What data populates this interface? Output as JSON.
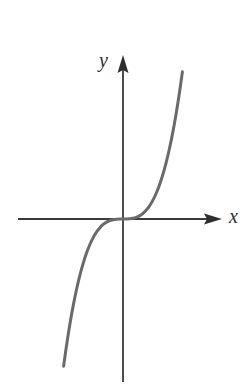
{
  "figure": {
    "background_color": "#ffffff",
    "width": 251,
    "height": 388
  },
  "axes": {
    "x_axis": {
      "label": "x",
      "icon": "arrow-right-icon",
      "color": "#3a3a3a",
      "start_px": [
        18,
        219
      ],
      "end_px": [
        222,
        219
      ],
      "arrow": "right"
    },
    "y_axis": {
      "label": "y",
      "icon": "arrow-up-icon",
      "color": "#3a3a3a",
      "start_px": [
        123,
        382
      ],
      "end_px": [
        123,
        55
      ],
      "arrow": "up"
    },
    "origin_px": [
      123,
      219
    ]
  },
  "curve": {
    "name": "cubic-curve",
    "color": "#6a6a6a",
    "stroke_width": 3,
    "equation": "y = x^3"
  },
  "chart_data": {
    "type": "line",
    "title": "",
    "subtitle": "",
    "xlabel": "x",
    "ylabel": "y",
    "grid": false,
    "legend_position": "none",
    "xlim": [
      -3.0,
      3.0
    ],
    "ylim": [
      -6.5,
      6.5
    ],
    "axis_arrows": {
      "x": "right",
      "y": "up"
    },
    "origin_shown": true,
    "tick_labels": {
      "x": [],
      "y": []
    },
    "annotations": [],
    "series": [
      {
        "name": "y = x^3",
        "equation": "y = x^3",
        "color": "#6a6a6a",
        "x": [
          -1.8,
          -1.7,
          -1.6,
          -1.5,
          -1.4,
          -1.3,
          -1.2,
          -1.1,
          -1.0,
          -0.9,
          -0.8,
          -0.7,
          -0.6,
          -0.5,
          -0.4,
          -0.3,
          -0.2,
          -0.1,
          0.0,
          0.1,
          0.2,
          0.3,
          0.4,
          0.5,
          0.6,
          0.7,
          0.8,
          0.9,
          1.0,
          1.1,
          1.2,
          1.3,
          1.4,
          1.5,
          1.6,
          1.7,
          1.8
        ],
        "y": [
          -5.832,
          -4.913,
          -4.096,
          -3.375,
          -2.744,
          -2.197,
          -1.728,
          -1.331,
          -1.0,
          -0.729,
          -0.512,
          -0.343,
          -0.216,
          -0.125,
          -0.064,
          -0.027,
          -0.008,
          -0.001,
          0.0,
          0.001,
          0.008,
          0.027,
          0.064,
          0.125,
          0.216,
          0.343,
          0.512,
          0.729,
          1.0,
          1.331,
          1.728,
          2.197,
          2.744,
          3.375,
          4.096,
          4.913,
          5.832
        ]
      }
    ]
  }
}
